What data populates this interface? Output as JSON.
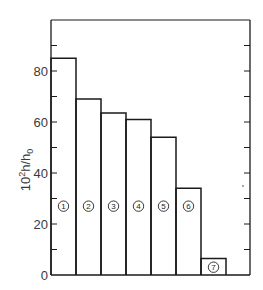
{
  "chart_data": {
    "type": "bar",
    "title": "",
    "xlabel": "",
    "ylabel": "10²h/h₀",
    "ylabel_main": "10",
    "ylabel_sup": "2",
    "ylabel_rest": "h/h",
    "ylabel_sub": "0",
    "categories": [
      "1",
      "2",
      "3",
      "4",
      "5",
      "6",
      "7"
    ],
    "values": [
      85,
      69,
      63.5,
      61,
      54,
      34,
      6.5
    ],
    "ylim": [
      0,
      100
    ],
    "yticks": [
      0,
      20,
      40,
      60,
      80
    ],
    "minor_yticks": [
      10,
      30,
      50,
      70,
      90
    ],
    "grid": false,
    "legend": "none",
    "bar_labels": [
      "①",
      "②",
      "③",
      "④",
      "⑤",
      "⑥",
      "⑦"
    ],
    "bar_label_value": 27,
    "colors": {
      "stroke": "#1a1a1a",
      "fill": "#ffffff",
      "text": "#3a3a3a"
    }
  }
}
